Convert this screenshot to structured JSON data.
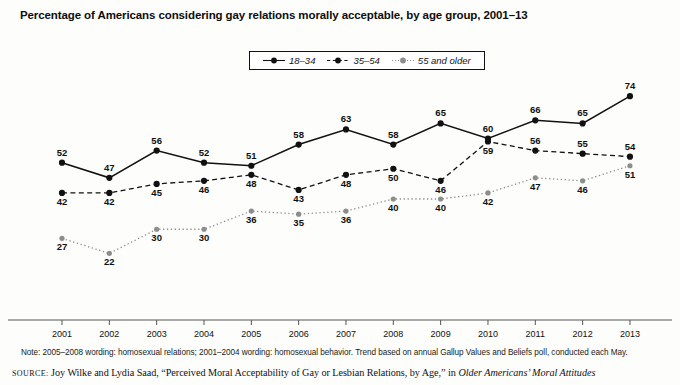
{
  "title": "Percentage of Americans considering gay relations morally acceptable, by age group, 2001–13",
  "legend": {
    "items": [
      {
        "label": "18–34",
        "style": "solid",
        "color": "#111111"
      },
      {
        "label": "35–54",
        "style": "dashed",
        "color": "#111111"
      },
      {
        "label": "55 and older",
        "style": "dotted",
        "color": "#8d8d8d"
      }
    ]
  },
  "note": "Note: 2005–2008 wording: homosexual relations; 2001–2004 wording: homosexual behavior. Trend based on annual Gallup Values and Beliefs poll, conducted each May.",
  "source": {
    "label": "SOURCE:",
    "text": " Joy Wilke and Lydia Saad, “Perceived Moral Acceptability of Gay or Lesbian Relations, by Age,” in ",
    "italic": "Older Americans’ Moral Attitudes"
  },
  "chart_data": {
    "type": "line",
    "title": "Percentage of Americans considering gay relations morally acceptable, by age group, 2001–13",
    "xlabel": "",
    "ylabel": "",
    "categories": [
      "2001",
      "2002",
      "2003",
      "2004",
      "2005",
      "2006",
      "2007",
      "2008",
      "2009",
      "2010",
      "2011",
      "2012",
      "2013"
    ],
    "ylim": [
      0,
      80
    ],
    "grid": false,
    "legend_position": "top-center",
    "series": [
      {
        "name": "18–34",
        "style": "solid",
        "color": "#111111",
        "values": [
          52,
          47,
          56,
          52,
          51,
          58,
          63,
          58,
          65,
          60,
          66,
          65,
          74
        ],
        "label_pos": [
          "above",
          "above",
          "above",
          "above",
          "above",
          "above",
          "above",
          "above",
          "above",
          "above",
          "above",
          "above",
          "above"
        ]
      },
      {
        "name": "35–54",
        "style": "dashed",
        "color": "#111111",
        "values": [
          42,
          42,
          45,
          46,
          48,
          43,
          48,
          50,
          46,
          59,
          56,
          55,
          54
        ],
        "label_pos": [
          "below",
          "below",
          "below",
          "below",
          "below",
          "below",
          "below",
          "below",
          "below",
          "below",
          "above",
          "above",
          "above"
        ]
      },
      {
        "name": "55 and older",
        "style": "dotted",
        "color": "#8d8d8d",
        "values": [
          27,
          22,
          30,
          30,
          36,
          35,
          36,
          40,
          40,
          42,
          47,
          46,
          51
        ],
        "label_pos": [
          "below",
          "below",
          "below",
          "below",
          "below",
          "below",
          "below",
          "below",
          "below",
          "below",
          "below",
          "below",
          "below"
        ]
      }
    ]
  }
}
